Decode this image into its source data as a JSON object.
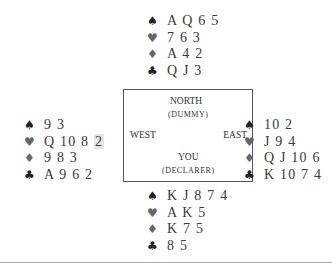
{
  "hands": {
    "north": {
      "spades": "A Q 6 5",
      "hearts": "7 6 3",
      "diamonds": "A 4 2",
      "clubs": "Q J 3"
    },
    "west": {
      "spades": "9 3",
      "hearts_main": "Q 10 8",
      "hearts_highlight": "2",
      "diamonds": "9 8 3",
      "clubs": "A 9 6 2"
    },
    "east": {
      "spades": "10 2",
      "hearts": "J 9 4",
      "diamonds": "Q J 10 6",
      "clubs": "K 10 7 4"
    },
    "south": {
      "spades": "K J 8 7 4",
      "hearts": "A K 5",
      "diamonds": "K 7 5",
      "clubs": "8 5"
    }
  },
  "table": {
    "north": "NORTH",
    "north_sub": "(DUMMY)",
    "west": "WEST",
    "east": "EAST",
    "south": "YOU",
    "south_sub": "(DECLARER)"
  },
  "suits": {
    "spade": "♠",
    "heart": "♥",
    "diamond": "♦",
    "club": "♣"
  }
}
